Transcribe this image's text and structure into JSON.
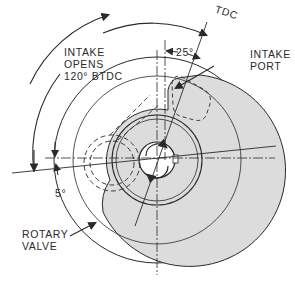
{
  "diagram": {
    "labels": {
      "tdc": "TDC",
      "angle_25": "25°",
      "intake_opens": [
        "INTAKE",
        "OPENS",
        "120° BTDC"
      ],
      "intake_port": [
        "INTAKE",
        "PORT"
      ],
      "angle_5": "5°",
      "rotary_valve": [
        "ROTARY",
        "VALVE"
      ]
    },
    "colors": {
      "line": "#2a2a2a",
      "valve_fill": "#dcdcdc",
      "background": "#ffffff"
    }
  }
}
